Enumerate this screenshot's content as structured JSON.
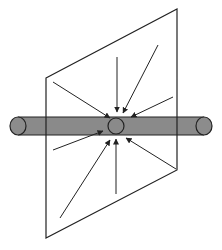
{
  "diagram": {
    "title": "",
    "colors": {
      "background": "#ffffff",
      "stroke": "#222222",
      "cylinder_fill": "#8a8a8a",
      "cap_fill": "#8c8c8c"
    },
    "plane": {
      "points": [
        [
          46,
          78
        ],
        [
          177,
          9
        ],
        [
          177,
          170
        ],
        [
          46,
          238
        ]
      ]
    },
    "cylinder": {
      "x1": 18,
      "x2": 204,
      "cy": 126,
      "radius": 9,
      "left_cap": {
        "cx": 18,
        "cy": 126,
        "rx": 8,
        "ry": 9
      },
      "right_cap": {
        "cx": 204,
        "cy": 126,
        "rx": 8,
        "ry": 9
      }
    },
    "center_circle": {
      "cx": 116,
      "cy": 126,
      "r": 8
    },
    "arrows": [
      {
        "x1": 117,
        "y1": 57,
        "x2": 117,
        "y2": 112
      },
      {
        "x1": 158,
        "y1": 45,
        "x2": 123,
        "y2": 113
      },
      {
        "x1": 173,
        "y1": 97,
        "x2": 131,
        "y2": 117
      },
      {
        "x1": 53,
        "y1": 82,
        "x2": 110,
        "y2": 118
      },
      {
        "x1": 53,
        "y1": 150,
        "x2": 103,
        "y2": 131
      },
      {
        "x1": 60,
        "y1": 218,
        "x2": 110,
        "y2": 140
      },
      {
        "x1": 116,
        "y1": 194,
        "x2": 116,
        "y2": 139
      },
      {
        "x1": 176,
        "y1": 169,
        "x2": 126,
        "y2": 138
      }
    ]
  }
}
